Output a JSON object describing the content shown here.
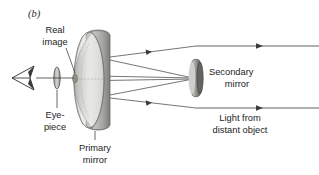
{
  "figure": {
    "panel_label": "(b)",
    "background_color": "#ffffff",
    "ink_color": "#1d1d1d"
  },
  "labels": {
    "real_image_line1": "Real",
    "real_image_line2": "image",
    "eyepiece_line1": "Eye-",
    "eyepiece_line2": "piece",
    "primary_mirror_line1": "Primary",
    "primary_mirror_line2": "mirror",
    "secondary_mirror_line1": "Secondary",
    "secondary_mirror_line2": "mirror",
    "incoming_light_line1": "Light from",
    "incoming_light_line2": "distant object"
  },
  "components": {
    "eye": {
      "name": "observer-eye",
      "x": 22,
      "y": 78
    },
    "eyepiece_lens": {
      "name": "eyepiece-lens",
      "x": 57,
      "y": 78
    },
    "real_image_point": {
      "name": "real-image-point",
      "x": 73,
      "y": 78
    },
    "primary_mirror": {
      "name": "primary-mirror",
      "x": 98,
      "y": 80
    },
    "secondary_mirror": {
      "name": "secondary-mirror",
      "x": 197,
      "y": 77
    }
  },
  "colors": {
    "mirror_light": "#e4e4e2",
    "mirror_mid": "#c9c9c6",
    "mirror_dark": "#9a9a97",
    "mirror_edge": "#6e6e6b",
    "secondary_dark": "#6b6b68",
    "ray_line": "#3a3a3a"
  },
  "rays": {
    "incoming_count": 2,
    "incoming_direction": "leftward",
    "converging_count": 4,
    "description": "Parallel light from a distant object travels left, reflects off the concave primary mirror, converges toward the secondary mirror, then is directed back to the real image and eyepiece."
  }
}
